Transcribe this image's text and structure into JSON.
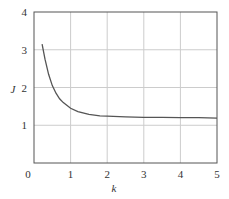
{
  "chart_data": {
    "type": "line",
    "title": "",
    "xlabel": "k",
    "ylabel": "J",
    "xlim": [
      0,
      5
    ],
    "ylim": [
      0,
      4
    ],
    "xticks": [
      "0",
      "1",
      "2",
      "3",
      "4",
      "5"
    ],
    "yticks": [
      "1",
      "2",
      "3",
      "4"
    ],
    "grid": true,
    "legend": null,
    "series": [
      {
        "name": "J(k)",
        "x": [
          0.22,
          0.3,
          0.4,
          0.5,
          0.6,
          0.7,
          0.8,
          1.0,
          1.2,
          1.5,
          1.8,
          2.0,
          2.5,
          3.0,
          3.5,
          4.0,
          4.5,
          5.0
        ],
        "y": [
          3.15,
          2.75,
          2.35,
          2.05,
          1.85,
          1.7,
          1.6,
          1.45,
          1.36,
          1.29,
          1.25,
          1.24,
          1.22,
          1.21,
          1.21,
          1.2,
          1.2,
          1.19
        ]
      }
    ]
  },
  "colors": {
    "axis": "#555555",
    "grid": "#cccccc",
    "line": "#555555"
  }
}
